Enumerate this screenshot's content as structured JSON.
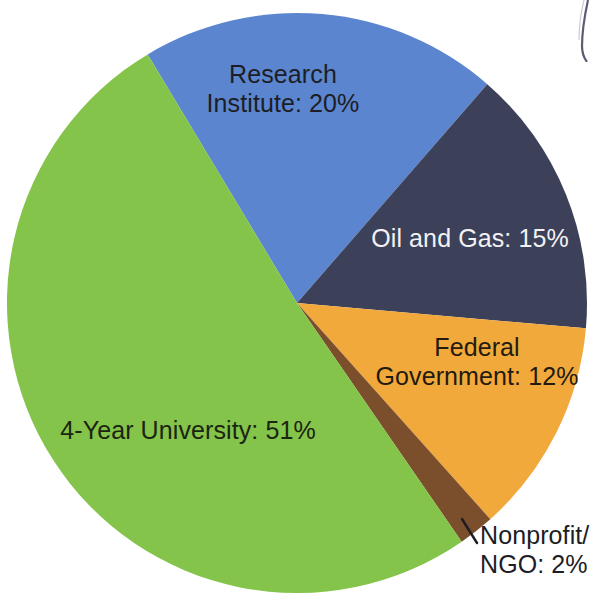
{
  "chart_data": {
    "type": "pie",
    "title": "",
    "subtitle": "",
    "xlabel": "",
    "ylabel": "",
    "legend_position": "none",
    "grid": false,
    "labels_inside": true,
    "unit": "%",
    "categories": [
      "Research Institute",
      "Oil and Gas",
      "Federal Government",
      "Nonprofit/NGO",
      "4-Year University"
    ],
    "values": [
      20,
      15,
      12,
      2,
      51
    ],
    "slices": [
      {
        "name": "Research Institute",
        "value": 20,
        "label": "Research\nInstitute: 20%",
        "color": "#5b86cf",
        "text_color": "#1d1d26",
        "start_angle": 329,
        "end_angle": 401,
        "callout": false
      },
      {
        "name": "Oil and Gas",
        "value": 15,
        "label": "Oil and Gas: 15%",
        "color": "#3c4059",
        "text_color": "#f2f2f4",
        "start_angle": 401,
        "end_angle": 455,
        "callout": false
      },
      {
        "name": "Federal Government",
        "value": 12,
        "label": "Federal\nGovernment: 12%",
        "color": "#f2a93c",
        "text_color": "#231a10",
        "start_angle": 455,
        "end_angle": 498.2,
        "callout": false
      },
      {
        "name": "Nonprofit/NGO",
        "value": 2,
        "label": "Nonprofit/\nNGO: 2%",
        "color": "#7b4f2c",
        "text_color": "#1d1d26",
        "start_angle": 498.2,
        "end_angle": 505.4,
        "callout": true
      },
      {
        "name": "4-Year University",
        "value": 51,
        "label": "4-Year University: 51%",
        "color": "#84c44a",
        "text_color": "#1b2410",
        "start_angle": 505.4,
        "end_angle": 689,
        "callout": false
      }
    ],
    "geometry": {
      "center_x": 297,
      "center_y": 303,
      "radius": 290
    },
    "background_color": "#ffffff"
  }
}
